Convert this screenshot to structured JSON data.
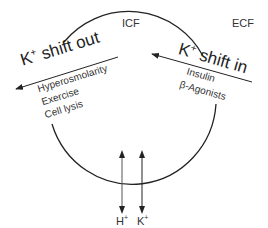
{
  "regions": {
    "inside": "ICF",
    "outside": "ECF"
  },
  "shift_out": {
    "title": "K",
    "title_sup": "+",
    "title_rest": " shift out",
    "causes": [
      "Hyperosmolarity",
      "Exercise",
      "Cell lysis"
    ]
  },
  "shift_in": {
    "title": "K",
    "title_sup": "+",
    "title_rest": " shift in",
    "causes": [
      "Insulin",
      "β-Agonists"
    ]
  },
  "exchange": {
    "ions": [
      {
        "label": "H",
        "sup": "+"
      },
      {
        "label": "K",
        "sup": "+"
      }
    ]
  },
  "colors": {
    "line": "#222222",
    "text": "#333333",
    "background": "#ffffff"
  }
}
